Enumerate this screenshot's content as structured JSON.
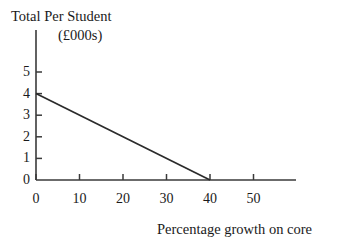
{
  "chart_data": {
    "type": "line",
    "title": "Total Per Student",
    "subtitle": "(£000s)",
    "xlabel": "Percentage growth on core",
    "ylabel": "",
    "xlim": [
      0,
      55
    ],
    "ylim": [
      0,
      5.6
    ],
    "xticks": [
      0,
      10,
      20,
      30,
      40,
      50
    ],
    "yticks": [
      0,
      1,
      2,
      3,
      4,
      5
    ],
    "xtick_labels": [
      "0",
      "10",
      "20",
      "30",
      "40",
      "50"
    ],
    "ytick_labels": [
      "0",
      "1",
      "2",
      "3",
      "4",
      "5"
    ],
    "grid": false,
    "legend": null,
    "series": [
      {
        "name": "Total per student",
        "color": "#2b2b2b",
        "x": [
          0,
          40
        ],
        "y": [
          4,
          0
        ]
      }
    ],
    "annotations": []
  },
  "axes": {
    "line_color": "#3a3a3a",
    "tick_color": "#3a3a3a",
    "background": "#ffffff"
  }
}
